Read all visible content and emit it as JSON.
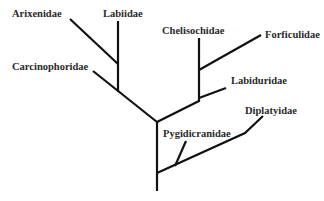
{
  "diagram": {
    "type": "phylogenetic-tree",
    "line_color": "#111111",
    "text_color": "#2a2a2a",
    "taxa": [
      {
        "id": "arixenidae",
        "label": "Arixenidae"
      },
      {
        "id": "labiidae",
        "label": "Labiidae"
      },
      {
        "id": "carcinophoridae",
        "label": "Carcinophoridae"
      },
      {
        "id": "chelisochidae",
        "label": "Chelisochidae"
      },
      {
        "id": "forficulidae",
        "label": "Forficulidae"
      },
      {
        "id": "labiduridae",
        "label": "Labiduridae"
      },
      {
        "id": "pygidicranidae",
        "label": "Pygidicranidae"
      },
      {
        "id": "diplatyidae",
        "label": "Diplatyidae"
      }
    ],
    "topology": "(((Arixenidae, Labiidae), Carcinophoridae), ((Chelisochidae, Forficulidae), Labiduridae)), (Pygidicranidae, Diplatyidae)"
  }
}
